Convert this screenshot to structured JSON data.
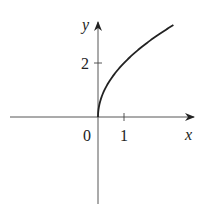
{
  "chart_data": {
    "type": "line",
    "title": "",
    "xlabel": "x",
    "ylabel": "y",
    "function": "y = 2*sqrt(x)",
    "x_ticks": [
      {
        "value": 1,
        "label": "1"
      }
    ],
    "y_ticks": [
      {
        "value": 2,
        "label": "2"
      }
    ],
    "origin_label": "0",
    "xlim": [
      -3.4,
      3.7
    ],
    "ylim": [
      -3.2,
      3.5
    ],
    "grid": false,
    "legend": null,
    "series": [
      {
        "name": "y = 2√x",
        "x": [
          0,
          0.05,
          0.1,
          0.25,
          0.5,
          1,
          1.5,
          2,
          2.5,
          2.9
        ],
        "y": [
          0,
          0.45,
          0.63,
          1.0,
          1.41,
          2.0,
          2.45,
          2.83,
          3.16,
          3.41
        ]
      }
    ],
    "color": "#222222"
  }
}
